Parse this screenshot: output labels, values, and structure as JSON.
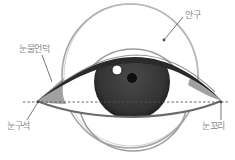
{
  "diagram": {
    "type": "eye-anatomy-sketch",
    "labels": {
      "eyeball": "안구",
      "caruncle": "눈물언덕",
      "inner_corner": "눈구석",
      "outer_corner": "눈꼬리"
    },
    "colors": {
      "outline": "#9a9a9a",
      "iris": "#3a3a3a",
      "pupil": "#111111",
      "lid": "#2a2a2a",
      "label": "#8a8a8a",
      "guide_line": "#555555"
    }
  }
}
